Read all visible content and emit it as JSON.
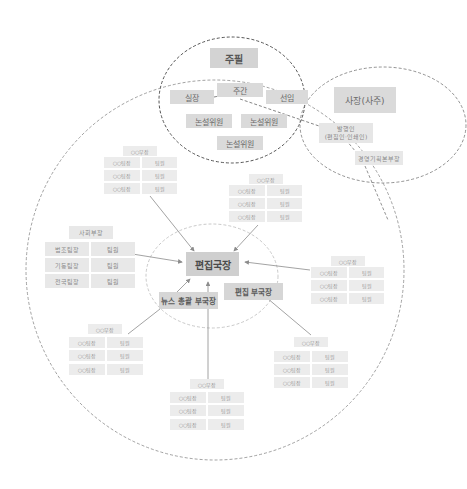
{
  "colors": {
    "background": "#ffffff",
    "box_dark": "#d3d3d3",
    "box_light": "#ececec",
    "dashed_line": "#777777",
    "arrow": "#8c8c8c"
  },
  "editorial_board": {
    "chief": "주필",
    "weekly": "주간",
    "director": "실장",
    "senior": "선임",
    "editorial_writers": [
      "논설위원",
      "논설위원",
      "논설위원"
    ]
  },
  "ownership": {
    "president": "사장(사주)",
    "publisher_line1": "발행인",
    "publisher_line2": "(편집인·인쇄인)",
    "management": "경영기획본부장"
  },
  "newsroom": {
    "editor_in_chief": "편집국장",
    "deputy_news": "뉴스 총괄 부국장",
    "deputy_edit": "편집 부국장"
  },
  "departments": [
    {
      "head": "○○부장",
      "rows": [
        [
          "○○팀장",
          "팀원"
        ],
        [
          "○○팀장",
          "팀원"
        ],
        [
          "○○팀장",
          "팀원"
        ]
      ]
    },
    {
      "head": "○○부장",
      "rows": [
        [
          "○○팀장",
          "팀원"
        ],
        [
          "○○팀장",
          "팀원"
        ],
        [
          "○○팀장",
          "팀원"
        ]
      ]
    },
    {
      "head": "사회부장",
      "rows": [
        [
          "법조팀장",
          "팀원"
        ],
        [
          "기동팀장",
          "팀원"
        ],
        [
          "전국팀장",
          "팀원"
        ]
      ]
    },
    {
      "head": "○○부장",
      "rows": [
        [
          "○○팀장",
          "팀원"
        ],
        [
          "○○팀장",
          "팀원"
        ],
        [
          "○○팀장",
          "팀원"
        ]
      ]
    },
    {
      "head": "○○부장",
      "rows": [
        [
          "○○팀장",
          "팀원"
        ],
        [
          "○○팀장",
          "팀원"
        ],
        [
          "○○팀장",
          "팀원"
        ]
      ]
    },
    {
      "head": "○○부장",
      "rows": [
        [
          "○○팀장",
          "팀원"
        ],
        [
          "○○팀장",
          "팀원"
        ],
        [
          "○○팀장",
          "팀원"
        ]
      ]
    },
    {
      "head": "○○부장",
      "rows": [
        [
          "○○팀장",
          "팀원"
        ],
        [
          "○○팀장",
          "팀원"
        ],
        [
          "○○팀장",
          "팀원"
        ]
      ]
    }
  ]
}
